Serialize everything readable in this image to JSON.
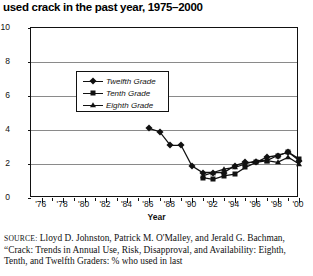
{
  "title": "used crack in the past year, 1975–2000",
  "axes": {
    "x_title": "Year",
    "x_tick_labels": [
      "'76",
      "'78",
      "'80",
      "'82",
      "'84",
      "'86",
      "'88",
      "'90",
      "'92",
      "'94",
      "'96",
      "'98",
      "'00"
    ],
    "y_tick_labels": [
      "0",
      "2",
      "4",
      "6",
      "8",
      "10"
    ]
  },
  "legend": {
    "items": [
      {
        "label": "Twelfth Grade",
        "marker": "diamond"
      },
      {
        "label": "Tenth Grade",
        "marker": "square"
      },
      {
        "label": "Eighth Grade",
        "marker": "triangle"
      }
    ]
  },
  "source": {
    "label": "SOURCE:",
    "text": " Lloyd D. Johnston, Patrick M. O'Malley, and Jerald G. Bachman, “Crack: Trends in Annual Use, Risk, Disapproval, and Availability: Eighth, Tenth, and Twelfth Graders: % who used in last"
  },
  "chart_data": {
    "type": "line",
    "title": "used crack in the past year, 1975–2000",
    "xlabel": "Year",
    "ylabel": "",
    "xlim": [
      1975,
      2000
    ],
    "ylim": [
      0,
      10
    ],
    "yticks": [
      0,
      2,
      4,
      6,
      8,
      10
    ],
    "xticks": [
      1976,
      1978,
      1980,
      1982,
      1984,
      1986,
      1988,
      1990,
      1992,
      1994,
      1996,
      1998,
      2000
    ],
    "grid": "horizontal",
    "legend_position": "upper-left-inside",
    "series": [
      {
        "name": "Twelfth Grade",
        "marker": "diamond",
        "x": [
          1986,
          1987,
          1988,
          1989,
          1990,
          1991,
          1992,
          1993,
          1994,
          1995,
          1996,
          1997,
          1998,
          1999,
          2000
        ],
        "values": [
          4.1,
          3.9,
          3.1,
          3.1,
          1.9,
          1.5,
          1.5,
          1.5,
          1.9,
          2.1,
          2.1,
          2.4,
          2.5,
          2.7,
          2.2
        ]
      },
      {
        "name": "Tenth Grade",
        "marker": "square",
        "x": [
          1991,
          1992,
          1993,
          1994,
          1995,
          1996,
          1997,
          1998,
          1999,
          2000
        ],
        "values": [
          1.2,
          1.1,
          1.3,
          1.4,
          1.8,
          2.1,
          2.2,
          2.5,
          2.7,
          2.3
        ]
      },
      {
        "name": "Eighth Grade",
        "marker": "triangle",
        "x": [
          1991,
          1992,
          1993,
          1994,
          1995,
          1996,
          1997,
          1998,
          1999,
          2000
        ],
        "values": [
          1.3,
          1.5,
          1.7,
          1.8,
          2.0,
          2.2,
          2.2,
          2.1,
          2.4,
          2.0
        ]
      }
    ]
  }
}
